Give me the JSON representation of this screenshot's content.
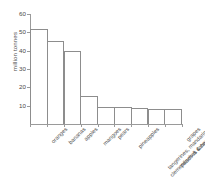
{
  "chart_data": {
    "type": "bar",
    "title": "",
    "xlabel": "",
    "ylabel": "million tonnes",
    "ylim": [
      0,
      60
    ],
    "yticks": [
      10,
      20,
      30,
      40,
      50,
      60
    ],
    "grid": false,
    "legend": null,
    "categories": [
      "oranges",
      "bananas",
      "apples",
      "mangoes",
      "pears",
      "pineapples",
      "tangerines, mandarins,\nclementines & satsumas",
      "peaches & nectarines",
      "grapes"
    ],
    "category_lines": [
      [
        "oranges"
      ],
      [
        "bananas"
      ],
      [
        "apples"
      ],
      [
        "mangoes"
      ],
      [
        "pears"
      ],
      [
        "pineapples"
      ],
      [
        "tangerines, mandarins,",
        "clementines & satsumas"
      ],
      [
        "peaches & nectarines"
      ],
      [
        "grapes"
      ]
    ],
    "values": [
      52,
      45.5,
      40,
      15.5,
      9.5,
      9.5,
      8.6,
      8.3,
      8.2
    ]
  },
  "style": {
    "bar_stroke": "#8d8d8d",
    "bar_fill": "transparent",
    "axis_color": "#9a9a9a",
    "text_color": "#4a4a4a",
    "background": "#ffffff"
  }
}
